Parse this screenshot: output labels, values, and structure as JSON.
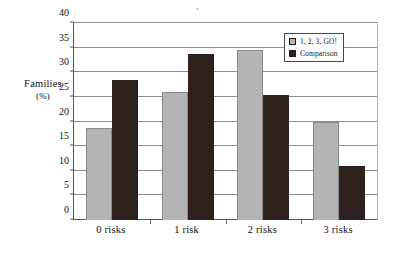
{
  "chart_data": {
    "type": "bar",
    "title": "",
    "xlabel": "",
    "ylabel": "Families (%)",
    "ylabel_line1": "Families",
    "ylabel_line2": "(%)",
    "categories": [
      "0 risks",
      "1 risk",
      "2 risks",
      "3 risks"
    ],
    "series": [
      {
        "name": "1, 2, 3, GO!",
        "color": "#b4b4b4",
        "values": [
          18.7,
          26.0,
          34.5,
          20.0
        ]
      },
      {
        "name": "Comparison",
        "color": "#2e201c",
        "values": [
          28.5,
          33.8,
          25.3,
          11.0
        ]
      }
    ],
    "ylim": [
      0,
      40
    ],
    "ytick_step": 5,
    "yticks": [
      "0",
      "5",
      "10",
      "15",
      "20",
      "25",
      "30",
      "35",
      "40"
    ],
    "grid": true,
    "legend_position": "top-right"
  },
  "legend": {
    "entries": [
      {
        "label": "1, 2, 3, GO!"
      },
      {
        "label": "Comparison"
      }
    ]
  }
}
